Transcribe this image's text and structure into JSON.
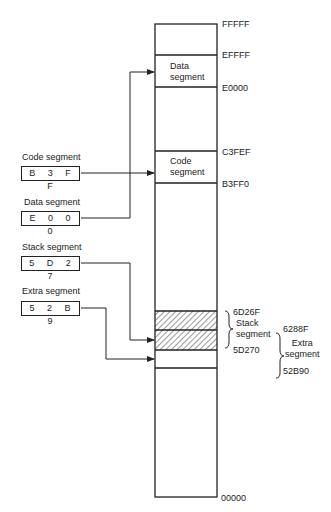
{
  "registers": [
    {
      "title": "Code segment",
      "value": "B 3 F F"
    },
    {
      "title": "Data segment",
      "value": "E 0 0 0"
    },
    {
      "title": "Stack segment",
      "value": "5 D 2 7"
    },
    {
      "title": "Extra segment",
      "value": "5 2 B 9"
    }
  ],
  "memory": {
    "addresses": {
      "top": "FFFFF",
      "data_end": "EFFFF",
      "data_start": "E0000",
      "code_end": "C3FEF",
      "code_start": "B3FF0",
      "stack_end": "6D26F",
      "stack_start": "5D270",
      "extra_end": "6288F",
      "extra_start": "52B90",
      "bottom": "00000"
    },
    "segments": {
      "data": [
        "Data",
        "segment"
      ],
      "code": [
        "Code",
        "segment"
      ],
      "stack": [
        "Stack",
        "segment"
      ],
      "extra": [
        "Extra",
        "segment"
      ]
    }
  }
}
